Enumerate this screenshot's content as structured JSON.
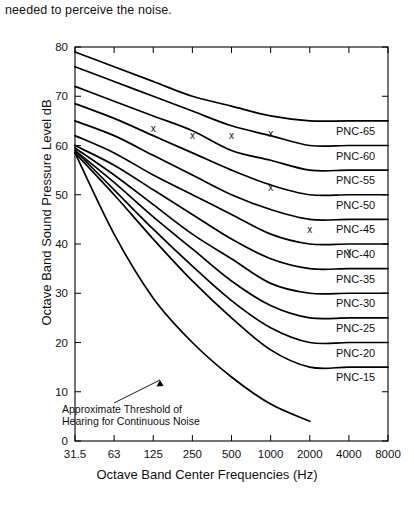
{
  "page": {
    "top_text": "needed to perceive the noise."
  },
  "chart_data": {
    "type": "line",
    "title": "",
    "xlabel": "Octave Band Center Frequencies (Hz)",
    "ylabel": "Octave Band Sound Pressure Level dB",
    "x": [
      31.5,
      63,
      125,
      250,
      500,
      1000,
      2000,
      4000,
      8000
    ],
    "xtick_labels": [
      "31.5",
      "63",
      "125",
      "250",
      "500",
      "1000",
      "2000",
      "4000",
      "8000"
    ],
    "xscale": "log-octave-even",
    "ytick_labels": [
      "0",
      "10",
      "20",
      "30",
      "40",
      "50",
      "60",
      "70",
      "80"
    ],
    "yticks": [
      0,
      10,
      20,
      30,
      40,
      50,
      60,
      70,
      80
    ],
    "ylim": [
      0,
      80
    ],
    "grid": false,
    "legend": "right-inline-labels",
    "line_color": "#000000",
    "series": [
      {
        "name": "PNC-65",
        "label": "PNC-65",
        "values": [
          79.0,
          76.0,
          73.0,
          70.0,
          68.0,
          66.0,
          65.0,
          65.0,
          65.0
        ]
      },
      {
        "name": "PNC-60",
        "label": "PNC-60",
        "values": [
          76.0,
          73.0,
          70.0,
          67.0,
          64.0,
          62.0,
          60.0,
          60.0,
          60.0
        ]
      },
      {
        "name": "PNC-55",
        "label": "PNC-55",
        "values": [
          72.0,
          69.0,
          66.0,
          63.0,
          59.0,
          57.0,
          55.0,
          55.0,
          55.0
        ]
      },
      {
        "name": "PNC-50",
        "label": "PNC-50",
        "values": [
          68.5,
          65.5,
          62.0,
          58.5,
          55.0,
          52.0,
          50.0,
          50.0,
          50.0
        ]
      },
      {
        "name": "PNC-45",
        "label": "PNC-45",
        "values": [
          65.0,
          62.0,
          58.0,
          54.0,
          50.0,
          47.0,
          45.0,
          45.0,
          45.0
        ]
      },
      {
        "name": "PNC-40",
        "label": "PNC-40",
        "values": [
          62.0,
          58.5,
          54.0,
          50.0,
          46.0,
          42.0,
          40.0,
          40.0,
          40.0
        ]
      },
      {
        "name": "PNC-35",
        "label": "PNC-35",
        "values": [
          60.0,
          56.0,
          51.0,
          46.0,
          41.0,
          37.0,
          35.0,
          35.0,
          35.0
        ]
      },
      {
        "name": "PNC-30",
        "label": "PNC-30",
        "values": [
          59.5,
          54.0,
          48.0,
          42.0,
          37.0,
          32.0,
          30.0,
          30.0,
          30.0
        ]
      },
      {
        "name": "PNC-25",
        "label": "PNC-25",
        "values": [
          59.0,
          52.5,
          45.5,
          39.0,
          32.5,
          27.5,
          25.0,
          25.0,
          25.0
        ]
      },
      {
        "name": "PNC-20",
        "label": "PNC-20",
        "values": [
          59.0,
          51.0,
          43.0,
          35.5,
          28.5,
          23.0,
          20.0,
          20.0,
          20.0
        ]
      },
      {
        "name": "PNC-15",
        "label": "PNC-15",
        "values": [
          58.5,
          50.0,
          41.0,
          32.5,
          25.0,
          18.5,
          15.0,
          15.0,
          15.0
        ]
      },
      {
        "name": "threshold",
        "label": "Approximate Threshold of Hearing for Continuous Noise",
        "values": [
          58.5,
          42.0,
          29.0,
          20.0,
          13.0,
          7.5,
          4.0,
          null,
          null
        ]
      }
    ],
    "annotations": [
      {
        "name": "threshold-note",
        "text_line_1": "Approximate Threshold of",
        "text_line_2": "Hearing for Continuous Noise"
      }
    ],
    "markers": [
      {
        "symbol": "x",
        "freq": 125,
        "level": 63.5
      },
      {
        "symbol": "x",
        "freq": 250,
        "level": 62.0
      },
      {
        "symbol": "x",
        "freq": 500,
        "level": 62.0
      },
      {
        "symbol": "x",
        "freq": 1000,
        "level": 62.5
      },
      {
        "symbol": "x",
        "freq": 1000,
        "level": 51.5
      },
      {
        "symbol": "x",
        "freq": 2000,
        "level": 43.0
      },
      {
        "symbol": "x",
        "freq": 4000,
        "level": 38.5
      }
    ],
    "marker_symbol": "x"
  }
}
